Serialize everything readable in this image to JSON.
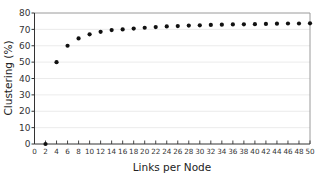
{
  "chart_data": {
    "type": "scatter",
    "title": "",
    "xlabel": "Links per Node",
    "ylabel": "Clustering (%)",
    "xlim": [
      0,
      50
    ],
    "ylim": [
      0,
      80
    ],
    "x_ticks": [
      0,
      2,
      4,
      6,
      8,
      10,
      12,
      14,
      16,
      18,
      20,
      22,
      24,
      26,
      28,
      30,
      32,
      34,
      36,
      38,
      40,
      42,
      44,
      46,
      48,
      50
    ],
    "y_ticks": [
      0,
      10,
      20,
      30,
      40,
      50,
      60,
      70,
      80
    ],
    "grid": {
      "horizontal": true,
      "vertical": false,
      "color": "#e6e6e6"
    },
    "legend": null,
    "series": [
      {
        "name": "Clustering",
        "color": "#111111",
        "x": [
          2,
          4,
          6,
          8,
          10,
          12,
          14,
          16,
          18,
          20,
          22,
          24,
          26,
          28,
          30,
          32,
          34,
          36,
          38,
          40,
          42,
          44,
          46,
          48,
          50
        ],
        "values": [
          0,
          50,
          60,
          64.5,
          67,
          68.5,
          69.6,
          70,
          70.5,
          71,
          71.4,
          71.8,
          72,
          72.3,
          72.5,
          72.7,
          72.9,
          73,
          73.1,
          73.2,
          73.3,
          73.5,
          73.6,
          73.6,
          73.7
        ]
      }
    ]
  }
}
